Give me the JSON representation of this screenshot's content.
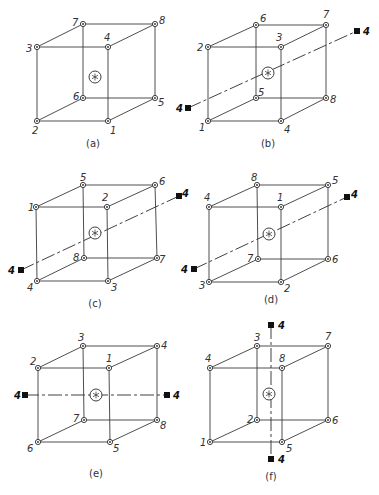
{
  "figure": {
    "edges": [
      [
        0,
        1
      ],
      [
        1,
        2
      ],
      [
        2,
        3
      ],
      [
        3,
        0
      ],
      [
        4,
        5
      ],
      [
        5,
        6
      ],
      [
        6,
        7
      ],
      [
        7,
        4
      ],
      [
        0,
        4
      ],
      [
        1,
        5
      ],
      [
        2,
        6
      ],
      [
        3,
        7
      ]
    ],
    "panels": [
      {
        "id": "a",
        "caption": "(a)",
        "caption_pos": [
          93,
          147
        ],
        "center": [
          95,
          77
        ],
        "vertices": [
          {
            "pos": [
              37,
              47
            ],
            "label": "3",
            "lpos": [
              26,
              52
            ]
          },
          {
            "pos": [
              108,
              47
            ],
            "label": "4",
            "lpos": [
              104,
              41
            ]
          },
          {
            "pos": [
              108,
              121
            ],
            "label": "1",
            "lpos": [
              110,
              134
            ]
          },
          {
            "pos": [
              37,
              121
            ],
            "label": "2",
            "lpos": [
              32,
              134
            ]
          },
          {
            "pos": [
              83,
              24
            ],
            "label": "7",
            "lpos": [
              72,
              26
            ]
          },
          {
            "pos": [
              155,
              24
            ],
            "label": "8",
            "lpos": [
              159,
              24
            ]
          },
          {
            "pos": [
              155,
              98
            ],
            "label": "5",
            "lpos": [
              158,
              106
            ]
          },
          {
            "pos": [
              83,
              98
            ],
            "label": "6",
            "lpos": [
              73,
              100
            ]
          }
        ],
        "axis": null
      },
      {
        "id": "b",
        "caption": "(b)",
        "caption_pos": [
          268,
          147
        ],
        "center": [
          268,
          73
        ],
        "vertices": [
          {
            "pos": [
              208,
              47
            ],
            "label": "2",
            "lpos": [
              197,
              51
            ]
          },
          {
            "pos": [
              281,
              47
            ],
            "label": "3",
            "lpos": [
              276,
              41
            ]
          },
          {
            "pos": [
              281,
              121
            ],
            "label": "4",
            "lpos": [
              284,
              133
            ]
          },
          {
            "pos": [
              208,
              121
            ],
            "label": "1",
            "lpos": [
              199,
              131
            ]
          },
          {
            "pos": [
              256,
              25
            ],
            "label": "6",
            "lpos": [
              260,
              22
            ]
          },
          {
            "pos": [
              326,
              25
            ],
            "label": "7",
            "lpos": [
              323,
              18
            ]
          },
          {
            "pos": [
              326,
              98
            ],
            "label": "8",
            "lpos": [
              330,
              103
            ]
          },
          {
            "pos": [
              256,
              98
            ],
            "label": "5",
            "lpos": [
              258,
              96
            ]
          }
        ],
        "axis": {
          "from": [
            188,
            108
          ],
          "to": [
            357,
            31
          ],
          "label": "4",
          "markers": [
            {
              "pos": [
                188,
                108
              ],
              "lpos": [
                176,
                112
              ]
            },
            {
              "pos": [
                357,
                31
              ],
              "lpos": [
                363,
                35
              ]
            }
          ]
        }
      },
      {
        "id": "c",
        "caption": "(c)",
        "caption_pos": [
          95,
          307
        ],
        "center": [
          95,
          233
        ],
        "vertices": [
          {
            "pos": [
              36,
              207
            ],
            "label": "1",
            "lpos": [
              28,
              211
            ]
          },
          {
            "pos": [
              107,
              207
            ],
            "label": "2",
            "lpos": [
              102,
              201
            ]
          },
          {
            "pos": [
              108,
              281
            ],
            "label": "3",
            "lpos": [
              111,
              291
            ]
          },
          {
            "pos": [
              37,
              281
            ],
            "label": "4",
            "lpos": [
              27,
              291
            ]
          },
          {
            "pos": [
              83,
              185
            ],
            "label": "5",
            "lpos": [
              80,
              181
            ]
          },
          {
            "pos": [
              155,
              185
            ],
            "label": "6",
            "lpos": [
              159,
              185
            ]
          },
          {
            "pos": [
              157,
              258
            ],
            "label": "7",
            "lpos": [
              159,
              263
            ]
          },
          {
            "pos": [
              84,
              258
            ],
            "label": "8",
            "lpos": [
              73,
              261
            ]
          }
        ],
        "axis": {
          "from": [
            21,
            270
          ],
          "to": [
            179,
            196
          ],
          "label": "4",
          "markers": [
            {
              "pos": [
                21,
                270
              ],
              "lpos": [
                8,
                274
              ]
            },
            {
              "pos": [
                179,
                196
              ],
              "lpos": [
                182,
                197
              ]
            }
          ]
        }
      },
      {
        "id": "d",
        "caption": "(d)",
        "caption_pos": [
          271,
          303
        ],
        "center": [
          269,
          234
        ],
        "vertices": [
          {
            "pos": [
              209,
              207
            ],
            "label": "4",
            "lpos": [
              204,
              201
            ]
          },
          {
            "pos": [
              281,
              207
            ],
            "label": "1",
            "lpos": [
              277,
              201
            ]
          },
          {
            "pos": [
              281,
              282
            ],
            "label": "2",
            "lpos": [
              284,
              292
            ]
          },
          {
            "pos": [
              209,
              282
            ],
            "label": "3",
            "lpos": [
              199,
              289
            ]
          },
          {
            "pos": [
              257,
              185
            ],
            "label": "8",
            "lpos": [
              251,
              181
            ]
          },
          {
            "pos": [
              328,
              185
            ],
            "label": "5",
            "lpos": [
              332,
              184
            ]
          },
          {
            "pos": [
              328,
              259
            ],
            "label": "6",
            "lpos": [
              332,
              263
            ]
          },
          {
            "pos": [
              258,
              259
            ],
            "label": "7",
            "lpos": [
              247,
              262
            ]
          }
        ],
        "axis": {
          "from": [
            194,
            269
          ],
          "to": [
            347,
            197
          ],
          "label": "4",
          "markers": [
            {
              "pos": [
                194,
                269
              ],
              "lpos": [
                181,
                273
              ]
            },
            {
              "pos": [
                347,
                197
              ],
              "lpos": [
                351,
                198
              ]
            }
          ]
        }
      },
      {
        "id": "e",
        "caption": "(e)",
        "caption_pos": [
          96,
          477
        ],
        "center": [
          96,
          395
        ],
        "vertices": [
          {
            "pos": [
              38,
              368
            ],
            "label": "2",
            "lpos": [
              30,
              365
            ]
          },
          {
            "pos": [
              109,
              368
            ],
            "label": "1",
            "lpos": [
              106,
              362
            ]
          },
          {
            "pos": [
              110,
              442
            ],
            "label": "5",
            "lpos": [
              113,
              452
            ]
          },
          {
            "pos": [
              38,
              442
            ],
            "label": "6",
            "lpos": [
              27,
              452
            ]
          },
          {
            "pos": [
              83,
              346
            ],
            "label": "3",
            "lpos": [
              78,
              341
            ]
          },
          {
            "pos": [
              157,
              346
            ],
            "label": "4",
            "lpos": [
              161,
              349
            ]
          },
          {
            "pos": [
              157,
              420
            ],
            "label": "8",
            "lpos": [
              160,
              429
            ]
          },
          {
            "pos": [
              84,
              420
            ],
            "label": "7",
            "lpos": [
              73,
              422
            ]
          }
        ],
        "axis": {
          "from": [
            25,
            395
          ],
          "to": [
            167,
            395
          ],
          "label": "4",
          "markers": [
            {
              "pos": [
                25,
                395
              ],
              "lpos": [
                14,
                399
              ]
            },
            {
              "pos": [
                167,
                395
              ],
              "lpos": [
                173,
                399
              ]
            }
          ]
        }
      },
      {
        "id": "f",
        "caption": "(f)",
        "caption_pos": [
          271,
          480
        ],
        "center": [
          269,
          394
        ],
        "vertices": [
          {
            "pos": [
              210,
              368
            ],
            "label": "4",
            "lpos": [
              205,
              362
            ]
          },
          {
            "pos": [
              282,
              368
            ],
            "label": "8",
            "lpos": [
              279,
              362
            ]
          },
          {
            "pos": [
              282,
              442
            ],
            "label": "5",
            "lpos": [
              286,
              452
            ]
          },
          {
            "pos": [
              210,
              442
            ],
            "label": "1",
            "lpos": [
              200,
              446
            ]
          },
          {
            "pos": [
              257,
              346
            ],
            "label": "3",
            "lpos": [
              254,
              341
            ]
          },
          {
            "pos": [
              328,
              346
            ],
            "label": "7",
            "lpos": [
              325,
              340
            ]
          },
          {
            "pos": [
              328,
              420
            ],
            "label": "6",
            "lpos": [
              332,
              424
            ]
          },
          {
            "pos": [
              257,
              420
            ],
            "label": "2",
            "lpos": [
              247,
              423
            ]
          }
        ],
        "axis": {
          "from": [
            271,
            325
          ],
          "to": [
            271,
            459
          ],
          "label": "4",
          "markers": [
            {
              "pos": [
                271,
                325
              ],
              "lpos": [
                278,
                329
              ]
            },
            {
              "pos": [
                271,
                459
              ],
              "lpos": [
                278,
                463
              ]
            }
          ]
        }
      }
    ]
  }
}
